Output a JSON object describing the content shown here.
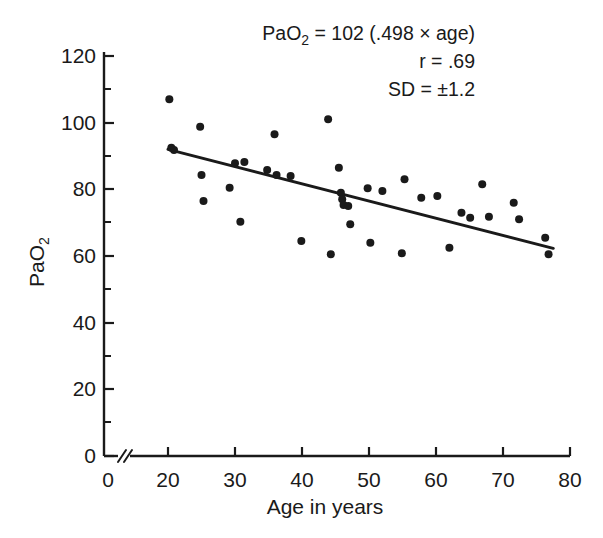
{
  "chart_data": {
    "type": "scatter",
    "title": "",
    "xlabel": "Age in years",
    "ylabel": "PaO2",
    "ylabel_display": "PaO",
    "ylabel_sub": "2",
    "xlim": [
      0,
      80
    ],
    "ylim": [
      0,
      120
    ],
    "x_ticks": [
      0,
      20,
      30,
      40,
      50,
      60,
      70,
      80
    ],
    "x_tick_labels": [
      "0",
      "20",
      "30",
      "40",
      "50",
      "60",
      "70",
      "80"
    ],
    "y_ticks": [
      0,
      20,
      40,
      60,
      80,
      100,
      120
    ],
    "y_tick_labels": [
      "0",
      "20",
      "40",
      "60",
      "80",
      "100",
      "120"
    ],
    "y_minor_ticks": [
      10,
      30,
      50,
      70,
      90,
      110
    ],
    "grid": false,
    "legend": "none",
    "axis_break_x": true,
    "axis_break_after": 0,
    "points": [
      [
        20.2,
        107.0
      ],
      [
        20.5,
        92.5
      ],
      [
        20.9,
        91.8
      ],
      [
        24.8,
        98.8
      ],
      [
        25.0,
        84.3
      ],
      [
        25.3,
        76.5
      ],
      [
        29.2,
        80.5
      ],
      [
        30.0,
        87.8
      ],
      [
        30.8,
        70.3
      ],
      [
        31.4,
        88.2
      ],
      [
        34.8,
        85.8
      ],
      [
        35.9,
        96.5
      ],
      [
        36.2,
        84.3
      ],
      [
        38.3,
        84.0
      ],
      [
        39.9,
        64.5
      ],
      [
        43.9,
        101.0
      ],
      [
        44.3,
        60.5
      ],
      [
        45.5,
        86.5
      ],
      [
        45.8,
        79.0
      ],
      [
        46.0,
        77.0
      ],
      [
        46.2,
        75.3
      ],
      [
        46.9,
        75.0
      ],
      [
        47.2,
        69.5
      ],
      [
        49.8,
        80.3
      ],
      [
        50.2,
        64.0
      ],
      [
        52.0,
        79.5
      ],
      [
        54.9,
        60.8
      ],
      [
        55.3,
        83.0
      ],
      [
        57.8,
        77.5
      ],
      [
        60.2,
        78.0
      ],
      [
        62.0,
        62.5
      ],
      [
        63.8,
        73.0
      ],
      [
        65.1,
        71.5
      ],
      [
        66.9,
        81.5
      ],
      [
        67.9,
        71.8
      ],
      [
        71.6,
        76.0
      ],
      [
        72.4,
        71.0
      ],
      [
        76.3,
        65.5
      ],
      [
        76.8,
        60.5
      ]
    ],
    "regression": {
      "x_start": 20.0,
      "y_start": 92.0,
      "x_end": 77.5,
      "y_end": 62.3,
      "equation": "PaO2 = 102 (.498 x age)",
      "r": 0.69,
      "sd": 1.2
    }
  },
  "annotation": {
    "line1_prefix": "PaO",
    "line1_sub": "2",
    "line1_rest": " = 102 (.498 × age)",
    "line2": "r = .69",
    "line3": "SD = ±1.2"
  },
  "axes": {
    "x_title": "Age in years",
    "y_title_main": "PaO",
    "y_title_sub": "2"
  }
}
